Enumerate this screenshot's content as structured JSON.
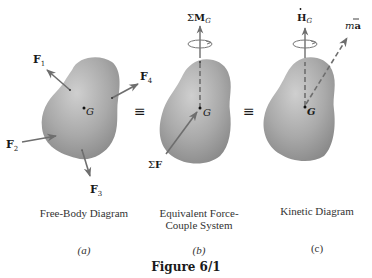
{
  "figure": {
    "title": "Figure 6/1",
    "colors": {
      "body_fill_light": "#c9c9c9",
      "body_fill_dark": "#8f8f8f",
      "arrow": "#6e6e6e",
      "text": "#1a1a1a"
    },
    "equivalence_symbol": "≡",
    "panels": [
      {
        "id": "a",
        "caption_line1": "Free-Body Diagram",
        "caption_line2": "",
        "tag": "(a)",
        "center_label": "G",
        "forces": [
          {
            "name": "F",
            "sub": "1"
          },
          {
            "name": "F",
            "sub": "4"
          },
          {
            "name": "F",
            "sub": "2"
          },
          {
            "name": "F",
            "sub": "3"
          }
        ]
      },
      {
        "id": "b",
        "caption_line1": "Equivalent Force-",
        "caption_line2": "Couple System",
        "tag": "(b)",
        "center_label": "G",
        "moment_label": {
          "prefix": "Σ",
          "name": "M",
          "sub": "G"
        },
        "force_label": {
          "prefix": "Σ",
          "name": "F"
        }
      },
      {
        "id": "c",
        "caption_line1": "Kinetic Diagram",
        "caption_line2": "",
        "tag": "(c)",
        "center_label": "G",
        "moment_label": {
          "dot": "·",
          "name": "H",
          "sub": "G"
        },
        "accel_label": {
          "m": "m",
          "a": "a",
          "bar": "‾"
        }
      }
    ]
  }
}
